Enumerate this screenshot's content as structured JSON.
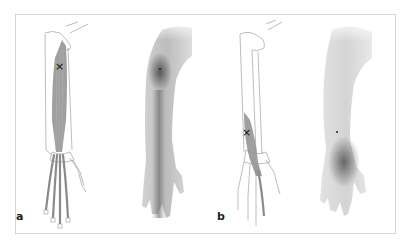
{
  "figure": {
    "panels": [
      {
        "label": "a",
        "views": [
          "skeleton-muscle",
          "referred-pain"
        ],
        "trigger_marker": "×"
      },
      {
        "label": "b",
        "views": [
          "skeleton-muscle",
          "referred-pain"
        ],
        "trigger_marker": "×"
      }
    ],
    "colors": {
      "frame": "#d6d6d6",
      "outline": "#9a9a9a",
      "muscle": "#8c8c8c",
      "pain_dark": "#5a5a5a",
      "skin": "#e4e4e4"
    }
  }
}
